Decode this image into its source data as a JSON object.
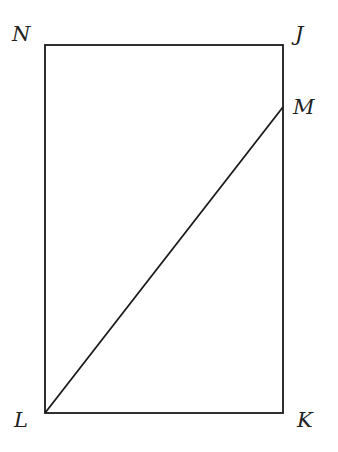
{
  "diagram": {
    "type": "geometry",
    "shape": "rectangle",
    "points": {
      "N": {
        "label": "N",
        "x": 45,
        "y": 45
      },
      "J": {
        "label": "J",
        "x": 283,
        "y": 45
      },
      "K": {
        "label": "K",
        "x": 283,
        "y": 413
      },
      "L": {
        "label": "L",
        "x": 45,
        "y": 413
      },
      "M": {
        "label": "M",
        "x": 283,
        "y": 107
      }
    },
    "segments": [
      "NJ",
      "JK",
      "KL",
      "LN",
      "LM"
    ],
    "colors": {
      "stroke": "#1a1a1a",
      "background": "#ffffff"
    }
  }
}
